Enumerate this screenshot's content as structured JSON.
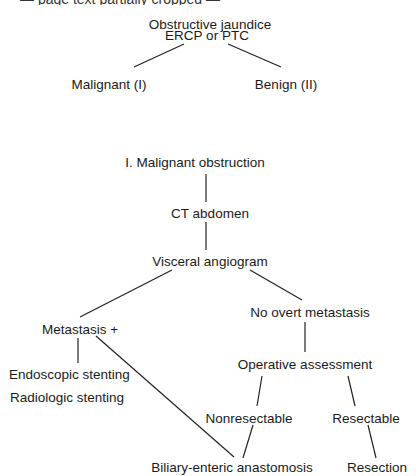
{
  "top_cut_text": "— page text partially cropped —",
  "nodes": {
    "root": "Obstructive jaundice",
    "ercp": "ERCP or PTC",
    "malignant": "Malignant (I)",
    "benign": "Benign (II)",
    "section": "I. Malignant obstruction",
    "ct": "CT abdomen",
    "angiogram": "Visceral angiogram",
    "metastasis": "Metastasis +",
    "no_metastasis": "No overt metastasis",
    "endoscopic": "Endoscopic stenting",
    "radiologic": "Radiologic stenting",
    "operative": "Operative assessment",
    "nonresectable": "Nonresectable",
    "resectable": "Resectable",
    "anastomosis": "Biliary-enteric anastomosis",
    "resection": "Resection"
  }
}
